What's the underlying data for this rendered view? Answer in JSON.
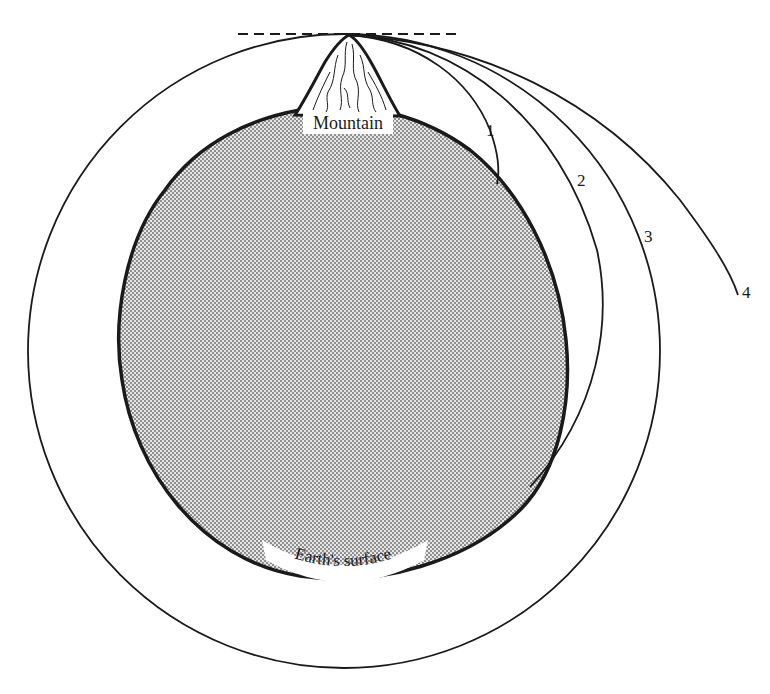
{
  "figure": {
    "labels": {
      "mountain": "Mountain",
      "earth": "Earth's surface",
      "trajectories": [
        "1",
        "2",
        "3",
        "4"
      ]
    },
    "colors": {
      "ink": "#1a1a1a",
      "earth_fill": "#c9c9c9",
      "background": "#ffffff"
    }
  }
}
